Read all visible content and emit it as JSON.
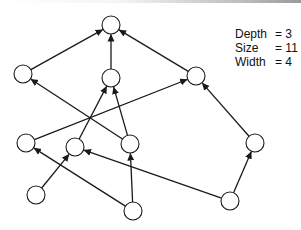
{
  "diagram": {
    "type": "directed-acyclic-graph",
    "node_radius": 9,
    "stroke_color": "#1a1a1a",
    "fill_color": "#ffffff",
    "nodes": [
      {
        "id": "n0",
        "x": 111,
        "y": 25
      },
      {
        "id": "n1",
        "x": 23,
        "y": 74
      },
      {
        "id": "n2",
        "x": 111,
        "y": 78
      },
      {
        "id": "n3",
        "x": 196,
        "y": 76
      },
      {
        "id": "n4",
        "x": 26,
        "y": 143
      },
      {
        "id": "n5",
        "x": 75,
        "y": 147
      },
      {
        "id": "n6",
        "x": 130,
        "y": 144
      },
      {
        "id": "n7",
        "x": 255,
        "y": 143
      },
      {
        "id": "n8",
        "x": 36,
        "y": 195
      },
      {
        "id": "n9",
        "x": 133,
        "y": 211
      },
      {
        "id": "n10",
        "x": 230,
        "y": 201
      }
    ],
    "edges": [
      {
        "from": "n1",
        "to": "n0"
      },
      {
        "from": "n2",
        "to": "n0"
      },
      {
        "from": "n3",
        "to": "n0"
      },
      {
        "from": "n6",
        "to": "n1"
      },
      {
        "from": "n5",
        "to": "n2"
      },
      {
        "from": "n6",
        "to": "n2"
      },
      {
        "from": "n4",
        "to": "n3"
      },
      {
        "from": "n7",
        "to": "n3"
      },
      {
        "from": "n8",
        "to": "n5"
      },
      {
        "from": "n9",
        "to": "n4"
      },
      {
        "from": "n9",
        "to": "n6"
      },
      {
        "from": "n10",
        "to": "n5"
      },
      {
        "from": "n10",
        "to": "n7"
      }
    ]
  },
  "stats": {
    "depth_label": "Depth",
    "depth_value": "= 3",
    "size_label": "Size",
    "size_value": "= 11",
    "width_label": "Width",
    "width_value": "= 4"
  }
}
